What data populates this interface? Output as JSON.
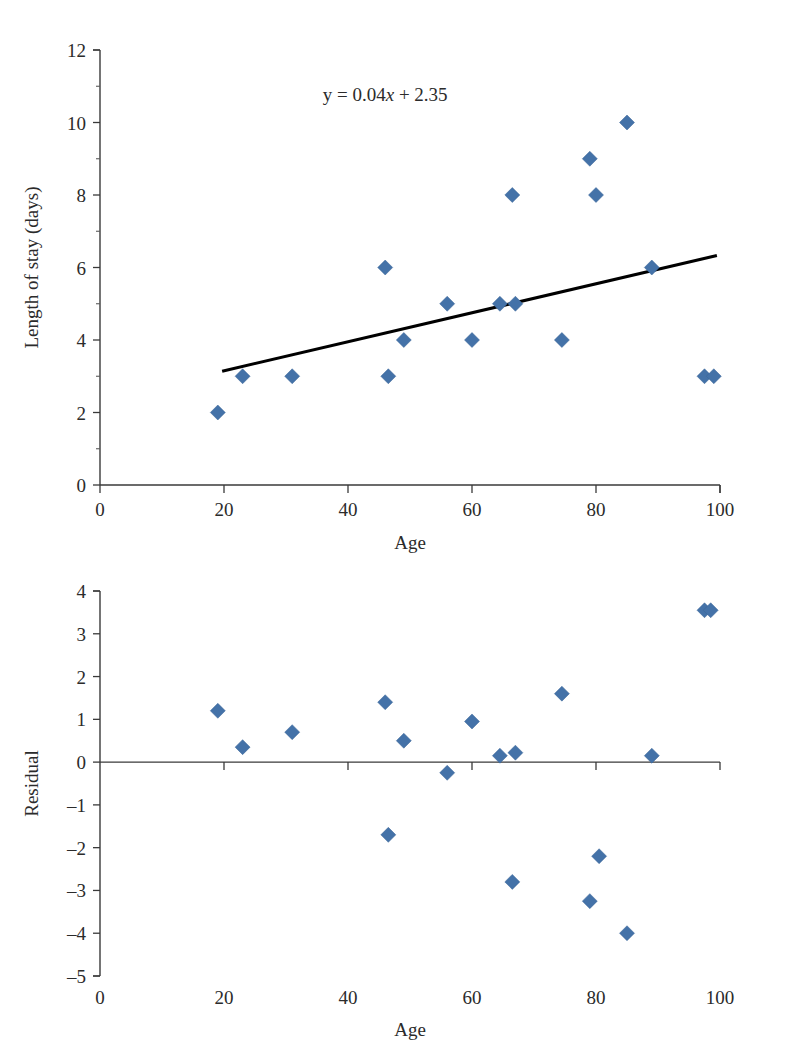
{
  "figure": {
    "background": "#ffffff",
    "marker_color": "#4472a8",
    "line_color": "#000000",
    "axis_color": "#3a3a3a"
  },
  "chart_data": [
    {
      "type": "scatter",
      "id": "length-of-stay-vs-age",
      "title": "",
      "xlabel": "Age",
      "ylabel": "Length of stay (days)",
      "xlim": [
        0,
        100
      ],
      "ylim": [
        0,
        12
      ],
      "xticks": [
        0,
        20,
        40,
        60,
        80,
        100
      ],
      "xticklabels": [
        "0",
        "20",
        "40",
        "60",
        "80",
        "100"
      ],
      "yticks": [
        0,
        2,
        4,
        6,
        8,
        10,
        12
      ],
      "yticklabels": [
        "0",
        "2",
        "4",
        "6",
        "8",
        "10",
        "12"
      ],
      "yminorticks": [
        1,
        3,
        5,
        7,
        9,
        11
      ],
      "grid": false,
      "legend": false,
      "annotation": {
        "text": "y = 0.04x + 2.35",
        "parts": [
          "y = 0.04",
          "x",
          " + 2.35"
        ],
        "x": 46,
        "y": 10.6
      },
      "series": [
        {
          "name": "Length of stay",
          "marker": "diamond",
          "color": "#4472a8",
          "points": [
            {
              "x": 19,
              "y": 2
            },
            {
              "x": 23,
              "y": 3
            },
            {
              "x": 31,
              "y": 3
            },
            {
              "x": 46,
              "y": 6
            },
            {
              "x": 46.5,
              "y": 3
            },
            {
              "x": 49,
              "y": 4
            },
            {
              "x": 56,
              "y": 5
            },
            {
              "x": 60,
              "y": 4
            },
            {
              "x": 64.5,
              "y": 5
            },
            {
              "x": 66.5,
              "y": 8
            },
            {
              "x": 67,
              "y": 5
            },
            {
              "x": 74.5,
              "y": 4
            },
            {
              "x": 79,
              "y": 9
            },
            {
              "x": 80,
              "y": 8
            },
            {
              "x": 85,
              "y": 10
            },
            {
              "x": 89,
              "y": 6
            },
            {
              "x": 97.5,
              "y": 3
            },
            {
              "x": 99,
              "y": 3
            }
          ]
        }
      ],
      "trendline": {
        "equation": "y = 0.04x + 2.35",
        "slope": 0.04,
        "intercept": 2.35,
        "x_start": 19.7,
        "x_end": 99.5,
        "y_start": 3.14,
        "y_end": 6.33
      }
    },
    {
      "type": "scatter",
      "id": "residual-vs-age",
      "title": "",
      "xlabel": "Age",
      "ylabel": "Residual",
      "xlim": [
        0,
        100
      ],
      "ylim": [
        -5,
        4
      ],
      "xticks": [
        0,
        20,
        40,
        60,
        80,
        100
      ],
      "xticklabels": [
        "0",
        "20",
        "40",
        "60",
        "80",
        "100"
      ],
      "yticks": [
        4,
        3,
        2,
        1,
        0,
        -1,
        -2,
        -3,
        -4,
        -5
      ],
      "yticklabels": [
        "4",
        "3",
        "2",
        "1",
        "0",
        "–1",
        "–2",
        "–3",
        "–4",
        "–5"
      ],
      "grid": false,
      "legend": false,
      "zero_reference_line": 0,
      "series": [
        {
          "name": "Residual",
          "marker": "diamond",
          "color": "#4472a8",
          "points": [
            {
              "x": 19,
              "y": 1.2
            },
            {
              "x": 23,
              "y": 0.35
            },
            {
              "x": 31,
              "y": 0.7
            },
            {
              "x": 46,
              "y": 1.4
            },
            {
              "x": 46.5,
              "y": -1.7
            },
            {
              "x": 49,
              "y": 0.5
            },
            {
              "x": 56,
              "y": -0.25
            },
            {
              "x": 60,
              "y": 0.95
            },
            {
              "x": 64.5,
              "y": 0.15
            },
            {
              "x": 66.5,
              "y": -2.8
            },
            {
              "x": 67,
              "y": 0.22
            },
            {
              "x": 74.5,
              "y": 1.6
            },
            {
              "x": 79,
              "y": -3.25
            },
            {
              "x": 80.5,
              "y": -2.2
            },
            {
              "x": 85,
              "y": -4.0
            },
            {
              "x": 89,
              "y": 0.15
            },
            {
              "x": 97.5,
              "y": 3.55
            },
            {
              "x": 98.5,
              "y": 3.55
            }
          ]
        }
      ]
    }
  ]
}
